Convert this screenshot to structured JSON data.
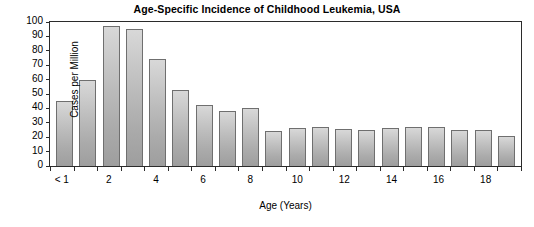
{
  "chart_data": {
    "type": "bar",
    "title": "Age-Specific Incidence of Childhood Leukemia, USA",
    "xlabel": "Age (Years)",
    "ylabel": "Cases per Million",
    "ylim": [
      0,
      100
    ],
    "ytick_step": 10,
    "yticks": [
      0,
      10,
      20,
      30,
      40,
      50,
      60,
      70,
      80,
      90,
      100
    ],
    "ytick_labels": [
      "0",
      "10",
      "20",
      "30",
      "40",
      "50",
      "60",
      "70",
      "80",
      "90",
      "100"
    ],
    "grid": false,
    "legend": "none",
    "categories": [
      "< 1",
      "1",
      "2",
      "3",
      "4",
      "5",
      "6",
      "7",
      "8",
      "9",
      "10",
      "11",
      "12",
      "13",
      "14",
      "15",
      "16",
      "17",
      "18",
      "19"
    ],
    "xtick_labels": [
      "< 1",
      "",
      "2",
      "",
      "4",
      "",
      "6",
      "",
      "8",
      "",
      "10",
      "",
      "12",
      "",
      "14",
      "",
      "16",
      "",
      "18",
      ""
    ],
    "values": [
      45,
      60,
      97,
      95,
      74,
      52.5,
      42.5,
      38,
      40,
      24.5,
      26.5,
      27,
      25.5,
      25,
      26.5,
      27,
      27,
      25,
      25,
      20.5
    ],
    "bar_fill_top": "#d8d8d8",
    "bar_fill_bottom": "#9e9e9e",
    "bar_edge_color": "#6f6f6f",
    "axis_color": "#2b2b2b",
    "background": "#ffffff"
  }
}
